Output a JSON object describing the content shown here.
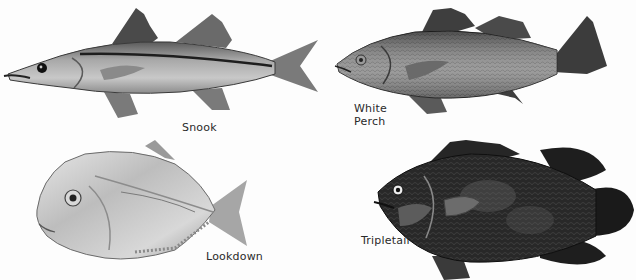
{
  "plate": {
    "background": "#fdfdfd",
    "style": "grayscale field-guide illustration"
  },
  "fish": [
    {
      "id": "snook",
      "label": "Snook",
      "tone": "#9a9a9a",
      "stripe": "#1e1e1e"
    },
    {
      "id": "white-perch",
      "label": "White\nPerch",
      "tone": "#7c7c7c"
    },
    {
      "id": "lookdown",
      "label": "Lookdown",
      "tone": "#c4c4c4"
    },
    {
      "id": "tripletail",
      "label": "Tripletail",
      "tone": "#2e2e2e"
    }
  ]
}
